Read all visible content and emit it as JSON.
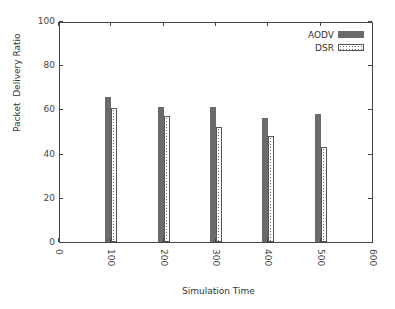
{
  "chart_data": {
    "type": "bar",
    "title": "",
    "xlabel": "Simulation Time",
    "ylabel": "Packet  Delivery Ratio",
    "categories": [
      "100",
      "200",
      "300",
      "400",
      "500"
    ],
    "x": [
      100,
      200,
      300,
      400,
      500
    ],
    "series": [
      {
        "name": "AODV",
        "values": [
          65.5,
          61,
          61,
          56,
          58
        ],
        "style": "solid",
        "color": "#6b6b6b"
      },
      {
        "name": "DSR",
        "values": [
          60.5,
          57,
          52,
          48,
          43
        ],
        "style": "checkered",
        "color": "#888888"
      }
    ],
    "xlim": [
      0,
      600
    ],
    "ylim": [
      0,
      100
    ],
    "xticks": [
      "0",
      "100",
      "200",
      "300",
      "400",
      "500",
      "600"
    ],
    "yticks": [
      "0",
      "20",
      "40",
      "60",
      "80",
      "100"
    ],
    "grid": false,
    "legend_position": "top-right"
  }
}
